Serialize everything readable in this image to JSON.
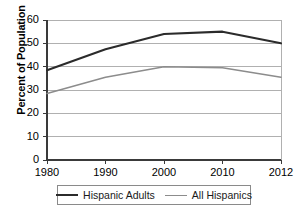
{
  "chart_data": {
    "type": "line",
    "title": "",
    "xlabel": "",
    "ylabel": "Percent of Population",
    "x": [
      1980,
      1990,
      2000,
      2010,
      2012
    ],
    "xtick_labels": [
      "1980",
      "1990",
      "2000",
      "2010",
      "2012"
    ],
    "ytick_labels": [
      "0",
      "10",
      "20",
      "30",
      "40",
      "50",
      "60"
    ],
    "yticks": [
      0,
      10,
      20,
      30,
      40,
      50,
      60
    ],
    "ylim": [
      0,
      60
    ],
    "xlim": [
      1980,
      2012
    ],
    "grid": true,
    "legend_position": "bottom",
    "series": [
      {
        "name": "Hispanic Adults",
        "color": "#2b2b2b",
        "values": [
          38.5,
          47.5,
          54.0,
          55.0,
          50.0
        ]
      },
      {
        "name": "All Hispanics",
        "color": "#8c8c8c",
        "values": [
          28.5,
          35.5,
          40.0,
          39.5,
          35.5
        ]
      }
    ]
  },
  "axis": {
    "y_title": "Percent of Population"
  },
  "legend": {
    "items": [
      {
        "label": "Hispanic Adults"
      },
      {
        "label": "All Hispanics"
      }
    ]
  },
  "colors": {
    "series_dark": "#2b2b2b",
    "series_light": "#8c8c8c",
    "grid": "#b0b0b0",
    "axis": "#3a3a3a",
    "background": "#ffffff"
  }
}
